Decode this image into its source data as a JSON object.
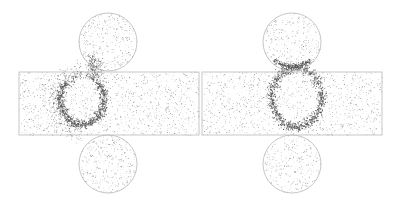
{
  "figure": {
    "width": 400,
    "height": 204,
    "background": "#ffffff",
    "outline_color": "#b9b9b9",
    "dot_color": "#555555",
    "panels": [
      {
        "id": "left",
        "rect": {
          "x": 19,
          "y": 72,
          "w": 180,
          "h": 63
        },
        "top_circle": {
          "cx": 108,
          "cy": 42,
          "r": 29
        },
        "bottom_circle": {
          "cx": 108,
          "cy": 164,
          "r": 29
        },
        "ring": {
          "cx": 82,
          "cy": 100,
          "rx": 22,
          "ry": 24,
          "open_top": true,
          "tail_to": [
            102,
            58
          ]
        },
        "background_density": 0.22,
        "seed": 7
      },
      {
        "id": "right",
        "rect": {
          "x": 202,
          "y": 72,
          "w": 180,
          "h": 63
        },
        "top_circle": {
          "cx": 292,
          "cy": 42,
          "r": 29
        },
        "bottom_circle": {
          "cx": 292,
          "cy": 164,
          "r": 29
        },
        "ring": {
          "cx": 296,
          "cy": 97,
          "rx": 25,
          "ry": 30,
          "open_top": false,
          "tail_to": null
        },
        "background_density": 0.2,
        "seed": 19
      }
    ]
  }
}
